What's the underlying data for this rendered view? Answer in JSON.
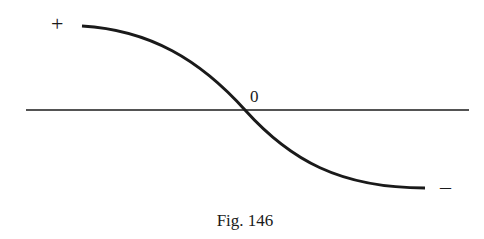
{
  "figure": {
    "caption": "Fig. 146",
    "labels": {
      "positive": "+",
      "zero": "0",
      "negative": "–"
    },
    "colors": {
      "ink": "#1a1a1a",
      "background": "#ffffff"
    }
  },
  "axis": {
    "x_start": 26,
    "x_end": 469,
    "y": 110
  },
  "curve": {
    "description": "Smooth S-shaped (sigmoid-like) decreasing curve from positive to negative, crossing the axis at zero",
    "start": [
      82,
      26
    ],
    "crossing": [
      245,
      110
    ],
    "end": [
      425,
      188
    ]
  }
}
